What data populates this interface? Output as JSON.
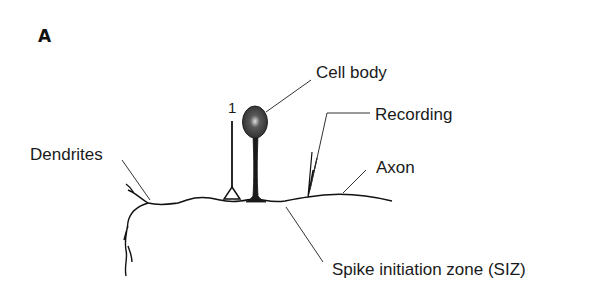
{
  "figure": {
    "panel_label": "A",
    "electrode_number": "1",
    "labels": {
      "cell_body": "Cell body",
      "recording": "Recording",
      "dendrites": "Dendrites",
      "axon": "Axon",
      "siz": "Spike initiation zone (SIZ)"
    },
    "colors": {
      "ink": "#111111",
      "leader": "#333333",
      "cell_body_fill": "#3a3a3a",
      "nucleus": "#bdbdbd"
    }
  }
}
